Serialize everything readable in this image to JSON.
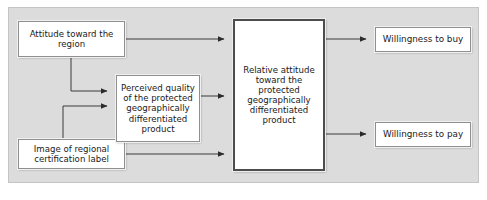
{
  "diagram": {
    "type": "conceptual-model-flow",
    "panel": {
      "background_color": "#dcdcdc",
      "border_color": "#c4c4c4"
    },
    "nodes": [
      {
        "id": "attitude-region",
        "label": "Attitude toward the\nregion",
        "position": "top-left"
      },
      {
        "id": "image-label",
        "label": "Image of regional\ncertification label",
        "position": "bottom-left"
      },
      {
        "id": "perceived-quality",
        "label": "Perceived quality\nof the protected\ngeographically\ndifferentiated\nproduct",
        "position": "middle-left"
      },
      {
        "id": "relative-attitude",
        "label": "Relative attitude\ntoward the\nprotected\ngeographically\ndifferentiated\nproduct",
        "position": "center"
      },
      {
        "id": "willingness-buy",
        "label": "Willingness to buy",
        "position": "top-right"
      },
      {
        "id": "willingness-pay",
        "label": "Willingness to pay",
        "position": "bottom-right"
      }
    ],
    "edges": [
      {
        "id": "attitude-region-to-relative-attitude",
        "from": "attitude-region",
        "to": "relative-attitude",
        "style": "straight"
      },
      {
        "id": "attitude-region-to-perceived-quality",
        "from": "attitude-region",
        "to": "perceived-quality",
        "style": "elbow"
      },
      {
        "id": "image-label-to-perceived-quality",
        "from": "image-label",
        "to": "perceived-quality",
        "style": "elbow"
      },
      {
        "id": "image-label-to-relative-attitude",
        "from": "image-label",
        "to": "relative-attitude",
        "style": "straight"
      },
      {
        "id": "perceived-quality-to-relative-attitude",
        "from": "perceived-quality",
        "to": "relative-attitude",
        "style": "straight"
      },
      {
        "id": "relative-attitude-to-willingness-buy",
        "from": "relative-attitude",
        "to": "willingness-buy",
        "style": "straight"
      },
      {
        "id": "relative-attitude-to-willingness-pay",
        "from": "relative-attitude",
        "to": "willingness-pay",
        "style": "straight"
      }
    ],
    "colors": {
      "node_fill": "#ffffff",
      "node_border": "#8f8f8f",
      "emphasis_border": "#4d4d4d",
      "connector": "#3a3a3a",
      "text": "#1a1a1a"
    }
  }
}
